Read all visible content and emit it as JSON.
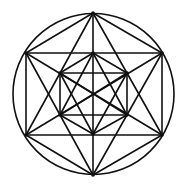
{
  "diagram": {
    "title": "",
    "stroke": "#111111",
    "background": "#ffffff",
    "circle": {
      "cx": 93.5,
      "cy": 94,
      "r": 80.5
    },
    "points": {
      "T": [
        93,
        13
      ],
      "B": [
        93,
        175
      ],
      "UL": [
        26,
        53
      ],
      "UR": [
        162,
        53
      ],
      "LL": [
        26,
        135
      ],
      "LR": [
        162,
        135
      ],
      "IT": [
        93,
        53
      ],
      "IB": [
        93,
        134
      ],
      "IUL": [
        60,
        73
      ],
      "IUR": [
        127,
        73
      ],
      "ILL": [
        60,
        115
      ],
      "ILR": [
        127,
        115
      ]
    },
    "segments": [
      [
        "T",
        "UL"
      ],
      [
        "T",
        "UR"
      ],
      [
        "B",
        "LL"
      ],
      [
        "B",
        "LR"
      ],
      [
        "UL",
        "UR"
      ],
      [
        "LL",
        "LR"
      ],
      [
        "UL",
        "LL"
      ],
      [
        "UR",
        "LR"
      ],
      [
        "T",
        "LL"
      ],
      [
        "T",
        "LR"
      ],
      [
        "B",
        "UL"
      ],
      [
        "B",
        "UR"
      ],
      [
        "T",
        "B"
      ],
      [
        "UL",
        "LR"
      ],
      [
        "UR",
        "LL"
      ],
      [
        "IT",
        "IUL"
      ],
      [
        "IT",
        "IUR"
      ],
      [
        "IB",
        "ILL"
      ],
      [
        "IB",
        "ILR"
      ],
      [
        "IT",
        "ILL"
      ],
      [
        "IT",
        "ILR"
      ],
      [
        "IB",
        "IUL"
      ],
      [
        "IB",
        "IUR"
      ],
      [
        "IUL",
        "IUR"
      ],
      [
        "ILL",
        "ILR"
      ],
      [
        "IUL",
        "ILL"
      ],
      [
        "IUR",
        "ILR"
      ],
      [
        "IUL",
        "ILR"
      ],
      [
        "IUR",
        "ILL"
      ]
    ]
  }
}
